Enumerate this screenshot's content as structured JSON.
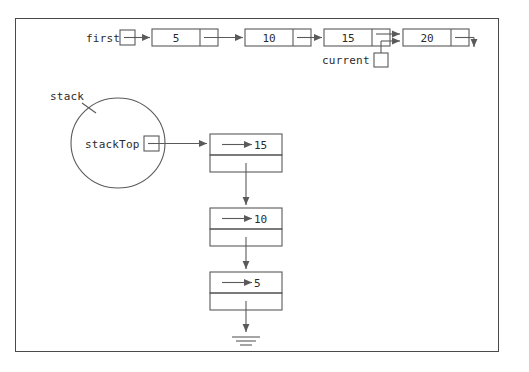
{
  "figure": {
    "caption_labels": {
      "first": "first",
      "current": "current",
      "stack": "stack",
      "stack_top": "stackTop"
    },
    "colors": {
      "border": "#4a4a4a",
      "stroke": "#5a5a5a",
      "text": "#2b2b2b",
      "background": "#ffffff"
    }
  },
  "linked_list": {
    "head_pointer_label": "first",
    "current_pointer_label": "current",
    "current_points_to": "20",
    "terminator": "down-arrow",
    "nodes": [
      {
        "value": "5"
      },
      {
        "value": "10"
      },
      {
        "value": "15"
      },
      {
        "value": "20"
      }
    ]
  },
  "stack": {
    "container_label": "stack",
    "top_pointer_label": "stackTop",
    "terminator": "ground-symbol",
    "nodes": [
      {
        "value": "15"
      },
      {
        "value": "10"
      },
      {
        "value": "5"
      }
    ]
  }
}
